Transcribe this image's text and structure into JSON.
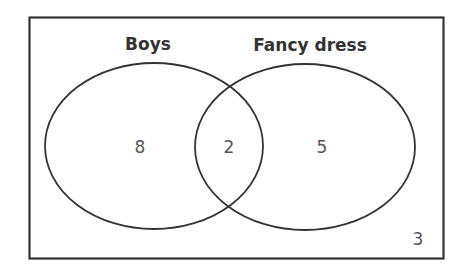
{
  "diagram": {
    "type": "venn",
    "sets": [
      {
        "name": "Boys",
        "only_value": "8"
      },
      {
        "name": "Fancy dress",
        "only_value": "5"
      }
    ],
    "intersection_value": "2",
    "outside_value": "3"
  },
  "colors": {
    "stroke": "#333333",
    "label": "#333333",
    "number": "#555555",
    "background": "#ffffff"
  }
}
